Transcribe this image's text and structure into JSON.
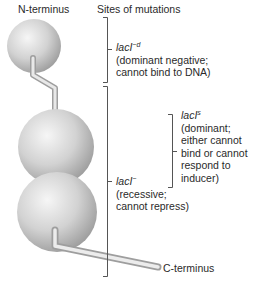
{
  "diagram": {
    "labels": {
      "n_terminus": "N-terminus",
      "c_terminus": "C-terminus",
      "sites_header": "Sites of mutations"
    },
    "mutations": [
      {
        "id": "lacI-d",
        "name": "lacI",
        "superscript": "−d",
        "description_lines": [
          "(dominant negative;",
          "cannot bind to DNA)"
        ]
      },
      {
        "id": "lacI-s",
        "name": "lacI",
        "superscript": "s",
        "description_lines": [
          "(dominant;",
          "either cannot",
          "bind or cannot",
          "respond to",
          "inducer)"
        ]
      },
      {
        "id": "lacI-minus",
        "name": "lacI",
        "superscript": "−",
        "description_lines": [
          "(recessive;",
          "cannot repress)"
        ]
      }
    ],
    "colors": {
      "sphere_light": "#f4f4f4",
      "sphere_mid": "#cfcfcf",
      "sphere_dark": "#9a9a9a",
      "bracket": "#555555",
      "text": "#2a2a2a"
    }
  }
}
